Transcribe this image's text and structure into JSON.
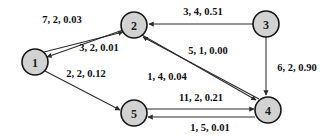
{
  "figure": {
    "type": "directed-graph",
    "background_color": "#ffffff",
    "node_fill_color": "#d2d2d2",
    "node_stroke_color": "#151515",
    "edge_color": "#2c2c2c",
    "label_color": "#101010"
  },
  "nodes": [
    {
      "id": "1",
      "label": "1",
      "x": 35,
      "y": 62,
      "r": 13
    },
    {
      "id": "2",
      "label": "2",
      "x": 134,
      "y": 25,
      "r": 13
    },
    {
      "id": "3",
      "label": "3",
      "x": 266,
      "y": 24,
      "r": 13
    },
    {
      "id": "4",
      "label": "4",
      "x": 268,
      "y": 110,
      "r": 13
    },
    {
      "id": "5",
      "label": "5",
      "x": 134,
      "y": 113,
      "r": 13
    }
  ],
  "edges": [
    {
      "name": "edge-1-to-2",
      "from": "1",
      "to": "2",
      "label": "7, 2, 0.03",
      "label_x": 62,
      "label_y": 19,
      "x1": 44,
      "y1": 52,
      "x2": 123,
      "y2": 32
    },
    {
      "name": "edge-2-to-1",
      "from": "2",
      "to": "1",
      "label": "3, 2, 0.01",
      "label_x": 99,
      "label_y": 47,
      "x1": 123,
      "y1": 30,
      "x2": 47,
      "y2": 57
    },
    {
      "name": "edge-3-to-2",
      "from": "3",
      "to": "2",
      "label": "3, 4, 0.51",
      "label_x": 203,
      "label_y": 11,
      "x1": 253,
      "y1": 24,
      "x2": 149,
      "y2": 24
    },
    {
      "name": "edge-3-to-4",
      "from": "3",
      "to": "4",
      "label": "6, 2, 0.90",
      "label_x": 297,
      "label_y": 67,
      "x1": 266,
      "y1": 37,
      "x2": 266,
      "y2": 95
    },
    {
      "name": "edge-4-to-2-upper",
      "from": "4",
      "to": "2",
      "label": "5, 1, 0.00",
      "label_x": 208,
      "label_y": 50,
      "x1": 259,
      "y1": 99,
      "x2": 143,
      "y2": 37
    },
    {
      "name": "edge-2-to-4-lower",
      "from": "2",
      "to": "4",
      "label": "1, 4, 0.04",
      "label_x": 167,
      "label_y": 76,
      "x1": 142,
      "y1": 35,
      "x2": 256,
      "y2": 100
    },
    {
      "name": "edge-1-to-5",
      "from": "1",
      "to": "5",
      "label": "2, 2, 0.12",
      "label_x": 86,
      "label_y": 73,
      "x1": 45,
      "y1": 71,
      "x2": 120,
      "y2": 110
    },
    {
      "name": "edge-5-to-4",
      "from": "5",
      "to": "4",
      "label": "11, 2, 0.21",
      "label_x": 201,
      "label_y": 97,
      "x1": 147,
      "y1": 109,
      "x2": 254,
      "y2": 109
    },
    {
      "name": "edge-4-to-5",
      "from": "4",
      "to": "5",
      "label": "1, 5, 0.01",
      "label_x": 210,
      "label_y": 127,
      "x1": 255,
      "y1": 117,
      "x2": 148,
      "y2": 117
    }
  ]
}
